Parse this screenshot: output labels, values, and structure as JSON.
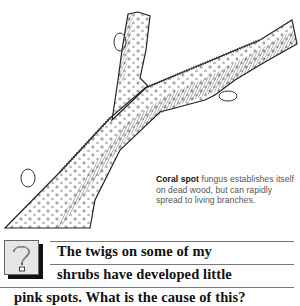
{
  "illustration": {
    "subject": "twig-with-coral-spot",
    "description": "Pen-and-ink drawing of a forked branch covered with small spots"
  },
  "caption": {
    "bold": "Coral spot",
    "text": " fungus establishes itself on dead wood, but can rapidly spread to living branches."
  },
  "question": {
    "icon": "question-mark-icon",
    "lines": [
      "The twigs on some of my",
      "shrubs have developed little",
      "pink spots. What is the cause of this?"
    ]
  },
  "colors": {
    "text": "#111111",
    "caption_text": "#555555",
    "rule": "#777777",
    "icon_bg": "#e6e6e6"
  }
}
